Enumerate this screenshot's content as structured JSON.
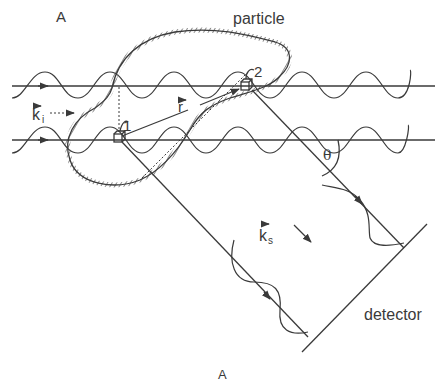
{
  "figure": {
    "top_label": "A",
    "bottom_label": "A",
    "particle_label": "particle",
    "detector_label": "detector",
    "incident_wavevector": {
      "symbol": "k",
      "subscript": "i"
    },
    "scattered_wavevector": {
      "symbol": "k",
      "subscript": "s"
    },
    "position_vector": {
      "symbol": "r"
    },
    "scattering_angle": "θ",
    "scatterer_1": "1",
    "scatterer_2": "2"
  },
  "colors": {
    "line": "#3a3a3a",
    "background": "#ffffff"
  }
}
